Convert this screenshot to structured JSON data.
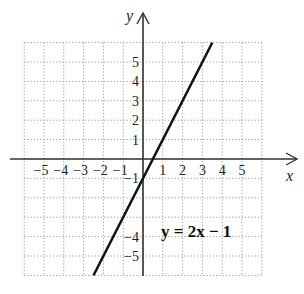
{
  "chart_data": {
    "type": "line",
    "title": "",
    "xlabel": "x",
    "ylabel": "y",
    "xlim": [
      -6,
      6
    ],
    "ylim": [
      -6,
      6
    ],
    "grid": true,
    "grid_style": "dotted",
    "x_tick_labels": [
      "-5",
      "-4",
      "-3",
      "-2",
      "-1",
      "1",
      "2",
      "3",
      "4",
      "5"
    ],
    "y_tick_labels": [
      "5",
      "4",
      "3",
      "2",
      "1",
      "-1",
      "-4",
      "-5"
    ],
    "series": [
      {
        "name": "y = 2x - 1",
        "equation": "y = 2x - 1",
        "slope": 2,
        "intercept": -1,
        "x": [
          -2.5,
          3.5
        ],
        "y": [
          -6,
          6
        ]
      }
    ],
    "annotations": [
      {
        "text": "y = 2x − 1",
        "x": 2.5,
        "y": -3.5
      }
    ]
  },
  "labels": {
    "x_axis": "x",
    "y_axis": "y",
    "equation": "y = 2x − 1",
    "x_ticks": [
      {
        "value": -5,
        "label": "−5"
      },
      {
        "value": -4,
        "label": "−4"
      },
      {
        "value": -3,
        "label": "−3"
      },
      {
        "value": -2,
        "label": "−2"
      },
      {
        "value": -1,
        "label": "−1"
      },
      {
        "value": 1,
        "label": "1"
      },
      {
        "value": 2,
        "label": "2"
      },
      {
        "value": 3,
        "label": "3"
      },
      {
        "value": 4,
        "label": "4"
      },
      {
        "value": 5,
        "label": "5"
      }
    ],
    "y_ticks": [
      {
        "value": 5,
        "label": "5"
      },
      {
        "value": 4,
        "label": "4"
      },
      {
        "value": 3,
        "label": "3"
      },
      {
        "value": 2,
        "label": "2"
      },
      {
        "value": 1,
        "label": "1"
      },
      {
        "value": -1,
        "label": "−1"
      },
      {
        "value": -4,
        "label": "−4"
      },
      {
        "value": -5,
        "label": "−5"
      }
    ]
  },
  "colors": {
    "line": "#111111",
    "axis": "#333333",
    "grid": "#9a9a9a"
  }
}
